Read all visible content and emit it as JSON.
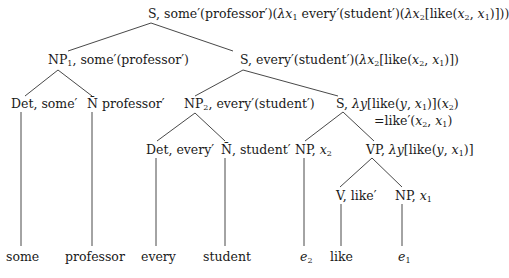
{
  "diagram": {
    "type": "syntax-semantics derivation tree",
    "nodes": {
      "root": {
        "category": "S",
        "semantics": "some'(professor')(λx1 every'(student')(λx2[like(x2, x1)]))"
      },
      "np1": {
        "category": "NP1",
        "semantics": "some'(professor')"
      },
      "s_every": {
        "category": "S",
        "semantics": "every'(student')(λx2[like(x2, x1)])"
      },
      "det_some": {
        "category": "Det",
        "semantics": "some'"
      },
      "n_professor": {
        "category": "N̄",
        "semantics": "professor'"
      },
      "np2": {
        "category": "NP2",
        "semantics": "every'(student')"
      },
      "s_lambda": {
        "category": "S",
        "semantics": "λy[like(y, x1)](x2)",
        "reduction": "=like'(x2, x1)"
      },
      "det_every": {
        "category": "Det",
        "semantics": "every'"
      },
      "n_student": {
        "category": "N̄",
        "semantics": "student'"
      },
      "np_x2": {
        "category": "NP",
        "semantics": "x2"
      },
      "vp": {
        "category": "VP",
        "semantics": "λy[like(y, x1)]"
      },
      "v_like": {
        "category": "V",
        "semantics": "like'"
      },
      "np_x1": {
        "category": "NP",
        "semantics": "x1"
      }
    },
    "leaves": [
      "some",
      "professor",
      "every",
      "student",
      "e2",
      "like",
      "e1"
    ],
    "edges": [
      [
        "root",
        "np1"
      ],
      [
        "root",
        "s_every"
      ],
      [
        "np1",
        "det_some"
      ],
      [
        "np1",
        "n_professor"
      ],
      [
        "s_every",
        "np2"
      ],
      [
        "s_every",
        "s_lambda"
      ],
      [
        "det_some",
        "leaf:some"
      ],
      [
        "n_professor",
        "leaf:professor"
      ],
      [
        "np2",
        "det_every"
      ],
      [
        "np2",
        "n_student"
      ],
      [
        "s_lambda",
        "np_x2"
      ],
      [
        "s_lambda",
        "vp"
      ],
      [
        "det_every",
        "leaf:every"
      ],
      [
        "n_student",
        "leaf:student"
      ],
      [
        "np_x2",
        "leaf:e2"
      ],
      [
        "vp",
        "v_like"
      ],
      [
        "vp",
        "np_x1"
      ],
      [
        "v_like",
        "leaf:like"
      ],
      [
        "np_x1",
        "leaf:e1"
      ]
    ]
  },
  "labels": {
    "root_prefix": "S, some′(professor′)(",
    "root_lambda": "λ",
    "root_x": "x",
    "root_sub1": "1",
    "root_mid": " every′(student′)(",
    "root_lambda2": "λ",
    "root_x2": "x",
    "root_sub2": "2",
    "root_like": "[like(",
    "root_a1": "x",
    "root_a1sub": "2",
    "root_comma": ", ",
    "root_a2": "x",
    "root_a2sub": "1",
    "root_end": ")]))",
    "np1_cat": "NP",
    "np1_sub": "1",
    "np1_sem": ", some′(professor′)",
    "se_prefix": "S, every′(student′)(",
    "se_lambda": "λ",
    "se_x": "x",
    "se_xsub": "2",
    "se_like": "[like(",
    "se_a1": "x",
    "se_a1sub": "2",
    "se_comma": ", ",
    "se_a2": "x",
    "se_a2sub": "1",
    "se_end": ")])",
    "det_some": "Det, some′",
    "n_professor_bar": "N̄",
    "n_professor_sem": " professor′",
    "np2_cat": "NP",
    "np2_sub": "2",
    "np2_sem": ", every′(student′)",
    "sl_prefix": "S, ",
    "sl_lambda": "λ",
    "sl_y": "y",
    "sl_like": "[like(",
    "sl_y2": "y",
    "sl_comma": ", ",
    "sl_x": "x",
    "sl_xsub": "1",
    "sl_mid": ")](",
    "sl_x2": "x",
    "sl_x2sub": "2",
    "sl_end": ")",
    "sl_red_prefix": "=like′(",
    "sl_red_a": "x",
    "sl_red_asub": "2",
    "sl_red_comma": ", ",
    "sl_red_b": "x",
    "sl_red_bsub": "1",
    "sl_red_end": ")",
    "det_every": "Det, every′",
    "n_student_bar": "N̄",
    "n_student_sem": ", student′",
    "npx2_cat": "NP, ",
    "npx2_x": "x",
    "npx2_sub": "2",
    "vp_prefix": "VP, ",
    "vp_lambda": "λ",
    "vp_y": "y",
    "vp_like": "[like(",
    "vp_y2": "y",
    "vp_comma": ", ",
    "vp_x": "x",
    "vp_xsub": "1",
    "vp_end": ")]",
    "v_like": "V, like′",
    "npx1_cat": "NP, ",
    "npx1_x": "x",
    "npx1_sub": "1",
    "leaf_some": "some",
    "leaf_professor": "professor",
    "leaf_every": "every",
    "leaf_student": "student",
    "leaf_e": "e",
    "leaf_e2_sub": "2",
    "leaf_like": "like",
    "leaf_e1": "e",
    "leaf_e1_sub": "1"
  }
}
